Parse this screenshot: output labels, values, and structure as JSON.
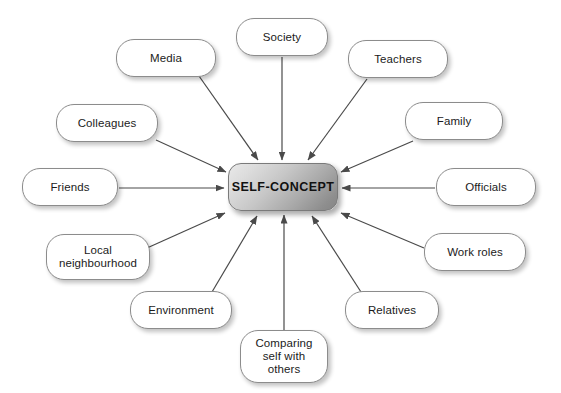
{
  "diagram": {
    "title": "SELF-CONCEPT",
    "type": "hub-and-spoke radial diagram",
    "background_color": "#ffffff",
    "hub": {
      "label": "SELF-CONCEPT",
      "x": 228,
      "y": 163,
      "width": 110,
      "height": 48,
      "fill_start": "#e9e9e9",
      "fill_end": "#848484",
      "border_color": "#7a7a7a"
    },
    "edge_color": "#4a4a4a",
    "node_border_color": "#8c8c8c",
    "node_fill": "#ffffff",
    "nodes": [
      {
        "id": "media",
        "label": "Media",
        "x": 116,
        "y": 39,
        "width": 100,
        "height": 38,
        "anchor_x": 199,
        "anchor_y": 76,
        "target_x": 258,
        "target_y": 160
      },
      {
        "id": "society",
        "label": "Society",
        "x": 236,
        "y": 18,
        "width": 92,
        "height": 38,
        "anchor_x": 282,
        "anchor_y": 57,
        "target_x": 282,
        "target_y": 160
      },
      {
        "id": "teachers",
        "label": "Teachers",
        "x": 348,
        "y": 40,
        "width": 100,
        "height": 38,
        "anchor_x": 367,
        "anchor_y": 79,
        "target_x": 308,
        "target_y": 160
      },
      {
        "id": "family",
        "label": "Family",
        "x": 405,
        "y": 102,
        "width": 98,
        "height": 38,
        "anchor_x": 413,
        "anchor_y": 141,
        "target_x": 341,
        "target_y": 172
      },
      {
        "id": "officials",
        "label": "Officials",
        "x": 436,
        "y": 168,
        "width": 100,
        "height": 38,
        "anchor_x": 435,
        "anchor_y": 188,
        "target_x": 342,
        "target_y": 188
      },
      {
        "id": "work-roles",
        "label": "Work roles",
        "x": 424,
        "y": 233,
        "width": 102,
        "height": 38,
        "anchor_x": 424,
        "anchor_y": 248,
        "target_x": 341,
        "target_y": 213
      },
      {
        "id": "relatives",
        "label": "Relatives",
        "x": 345,
        "y": 291,
        "width": 94,
        "height": 38,
        "anchor_x": 361,
        "anchor_y": 292,
        "target_x": 312,
        "target_y": 216
      },
      {
        "id": "comparing-self",
        "label": "Comparing\nself with\nothers",
        "x": 240,
        "y": 330,
        "width": 88,
        "height": 53,
        "anchor_x": 284,
        "anchor_y": 330,
        "target_x": 284,
        "target_y": 215
      },
      {
        "id": "environment",
        "label": "Environment",
        "x": 130,
        "y": 291,
        "width": 102,
        "height": 38,
        "anchor_x": 212,
        "anchor_y": 292,
        "target_x": 257,
        "target_y": 216
      },
      {
        "id": "local-neighbourhood",
        "label": "Local\nneighbourhood",
        "x": 46,
        "y": 234,
        "width": 104,
        "height": 46,
        "anchor_x": 147,
        "anchor_y": 248,
        "target_x": 225,
        "target_y": 213
      },
      {
        "id": "friends",
        "label": "Friends",
        "x": 22,
        "y": 168,
        "width": 96,
        "height": 38,
        "anchor_x": 119,
        "anchor_y": 188,
        "target_x": 224,
        "target_y": 188
      },
      {
        "id": "colleagues",
        "label": "Colleagues",
        "x": 56,
        "y": 104,
        "width": 102,
        "height": 38,
        "anchor_x": 156,
        "anchor_y": 140,
        "target_x": 226,
        "target_y": 172
      }
    ]
  }
}
